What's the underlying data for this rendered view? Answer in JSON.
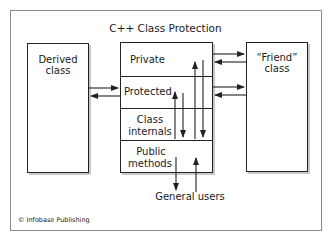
{
  "diagram": {
    "title": "C++ Class Protection",
    "derived_box": {
      "label_line1": "Derived",
      "label_line2": "class"
    },
    "friend_box": {
      "label_line1": "“Friend”",
      "label_line2": "class"
    },
    "class_box": {
      "sections": [
        {
          "label_line1": "Private",
          "label_line2": ""
        },
        {
          "label_line1": "Protected",
          "label_line2": ""
        },
        {
          "label_line1": "Class",
          "label_line2": "internals"
        },
        {
          "label_line1": "Public",
          "label_line2": "methods"
        }
      ]
    },
    "general_users": "General users",
    "footer": "© Infobase Publishing",
    "arrows": [
      {
        "from": "Derived class",
        "to": "Protected",
        "direction": "right"
      },
      {
        "from": "Protected",
        "to": "Derived class",
        "direction": "left"
      },
      {
        "from": "Private",
        "to": "Friend class",
        "direction": "right"
      },
      {
        "from": "Friend class",
        "to": "Private",
        "direction": "left"
      },
      {
        "from": "Protected",
        "to": "Friend class",
        "direction": "right"
      },
      {
        "from": "Friend class",
        "to": "Protected",
        "direction": "left"
      },
      {
        "from": "Class internals",
        "to": "Protected",
        "direction": "up"
      },
      {
        "from": "Protected",
        "to": "Class internals",
        "direction": "down"
      },
      {
        "from": "Class internals",
        "to": "Private",
        "direction": "up"
      },
      {
        "from": "Private",
        "to": "Class internals",
        "direction": "down"
      },
      {
        "from": "Public methods",
        "to": "General users",
        "direction": "down"
      },
      {
        "from": "General users",
        "to": "Public methods",
        "direction": "up"
      }
    ],
    "colors": {
      "line": "#222222",
      "shadow": "#c8c8c8",
      "frame": "#8a8a8a"
    }
  }
}
